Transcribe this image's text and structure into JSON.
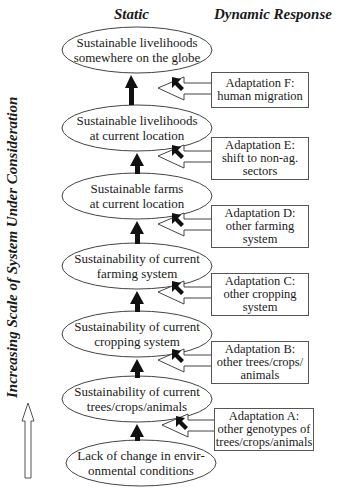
{
  "headers": {
    "static": "Static",
    "dynamic": "Dynamic Response"
  },
  "axis_label": "Increasing Scale of System Under Consideration",
  "static_levels": [
    {
      "line1": "Sustainable livelihoods",
      "line2": "somewhere on the globe"
    },
    {
      "line1": "Sustainable livelihoods",
      "line2": "at current location"
    },
    {
      "line1": "Sustainable farms",
      "line2": "at current location"
    },
    {
      "line1": "Sustainability of current",
      "line2": "farming system"
    },
    {
      "line1": "Sustainability of  current",
      "line2": "cropping system"
    },
    {
      "line1": "Sustainability of current",
      "line2": "trees/crops/animals"
    },
    {
      "line1": "Lack of change in envir-",
      "line2": "onmental conditions"
    }
  ],
  "adaptations": [
    {
      "lines": [
        "Adaptation F:",
        "human migration"
      ]
    },
    {
      "lines": [
        "Adaptation E:",
        "shift to non-ag.",
        "sectors"
      ]
    },
    {
      "lines": [
        "Adaptation D:",
        "other farming",
        "system"
      ]
    },
    {
      "lines": [
        "Adaptation C:",
        "other cropping",
        "system"
      ]
    },
    {
      "lines": [
        "Adaptation B:",
        "other trees/crops/",
        "animals"
      ]
    },
    {
      "lines": [
        "Adaptation A:",
        "other genotypes of",
        "trees/crops/animals"
      ]
    }
  ],
  "icons": {
    "up_arrow": "thick-up-arrow",
    "adaptation_arrow": "hollow-left-arrow",
    "pointer": "cursor-arrow",
    "scale_arrow": "hollow-up-arrow"
  }
}
